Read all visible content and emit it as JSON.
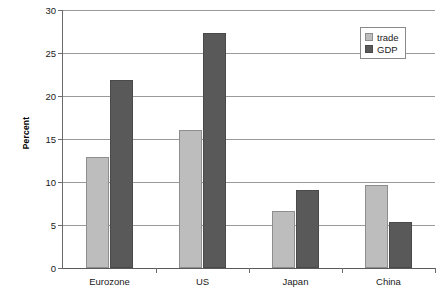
{
  "chart_data": {
    "type": "bar",
    "title": "",
    "xlabel": "",
    "ylabel": "Percent",
    "ylim": [
      0,
      30
    ],
    "yticks": [
      0,
      5,
      10,
      15,
      20,
      25,
      30
    ],
    "ytick_labels": [
      "0",
      "5",
      "10",
      "15",
      "20",
      "25",
      "30"
    ],
    "grid": true,
    "legend_position": "top-right",
    "categories": [
      "Eurozone",
      "US",
      "Japan",
      "China"
    ],
    "series": [
      {
        "name": "trade",
        "color": "#bdbdbd",
        "values": [
          12.9,
          16.0,
          6.6,
          9.6
        ]
      },
      {
        "name": "GDP",
        "color": "#595959",
        "values": [
          21.9,
          27.3,
          9.1,
          5.4
        ]
      }
    ]
  },
  "legend": {
    "items": [
      {
        "label": "trade"
      },
      {
        "label": "GDP"
      }
    ]
  }
}
